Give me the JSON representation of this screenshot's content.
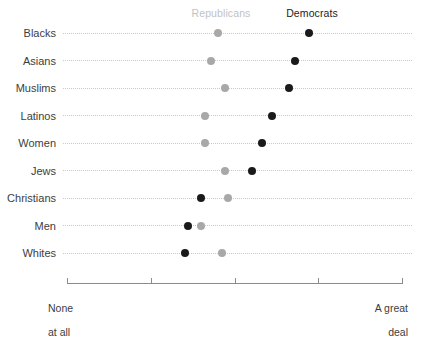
{
  "chart_data": {
    "type": "scatter",
    "title": "",
    "subtitle": "",
    "xlabel": "",
    "ylabel": "",
    "grid": "dotted-row-guides",
    "legend_position": "top",
    "axis": {
      "min_label": "None\nat all",
      "max_label": "A great\ndeal",
      "min_value": 0,
      "max_value": 100,
      "ticks": [
        0,
        25,
        50,
        75,
        100
      ],
      "tick_labels_shown": [
        "None at all",
        "",
        "",
        "",
        "A great deal"
      ]
    },
    "series": [
      {
        "name": "Republicans",
        "color": "#a8a8a8",
        "values": [
          45,
          43,
          47,
          41,
          41,
          47,
          48,
          40,
          46
        ]
      },
      {
        "name": "Democrats",
        "color": "#1a1a1a",
        "values": [
          72,
          68,
          66,
          61,
          58,
          55,
          40,
          36,
          35
        ]
      }
    ],
    "categories": [
      "Blacks",
      "Asians",
      "Muslims",
      "Latinos",
      "Women",
      "Jews",
      "Christians",
      "Men",
      "Whites"
    ]
  },
  "legend": {
    "republicans_label": "Republicans",
    "democrats_label": "Democrats"
  },
  "axis_labels": {
    "left_line1": "None",
    "left_line2": "at all",
    "right_line1": "A great",
    "right_line2": "deal"
  }
}
